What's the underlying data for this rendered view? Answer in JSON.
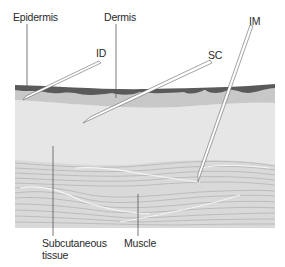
{
  "diagram": {
    "type": "injection-route cross-section",
    "labels": {
      "epidermis": "Epidermis",
      "dermis": "Dermis",
      "id": "ID",
      "sc": "SC",
      "im": "IM",
      "subcutaneous_line1": "Subcutaneous",
      "subcutaneous_line2": "tissue",
      "muscle": "Muscle"
    },
    "layers": [
      {
        "name": "Epidermis",
        "color": "#5e5e5e"
      },
      {
        "name": "Dermis",
        "color": "#c9c9c9"
      },
      {
        "name": "Subcutaneous tissue",
        "color": "#e4e4e4"
      },
      {
        "name": "Muscle",
        "color": "#d8d8d8"
      }
    ],
    "needles": [
      {
        "label": "ID",
        "target": "Dermis"
      },
      {
        "label": "SC",
        "target": "Subcutaneous tissue"
      },
      {
        "label": "IM",
        "target": "Muscle"
      }
    ]
  }
}
